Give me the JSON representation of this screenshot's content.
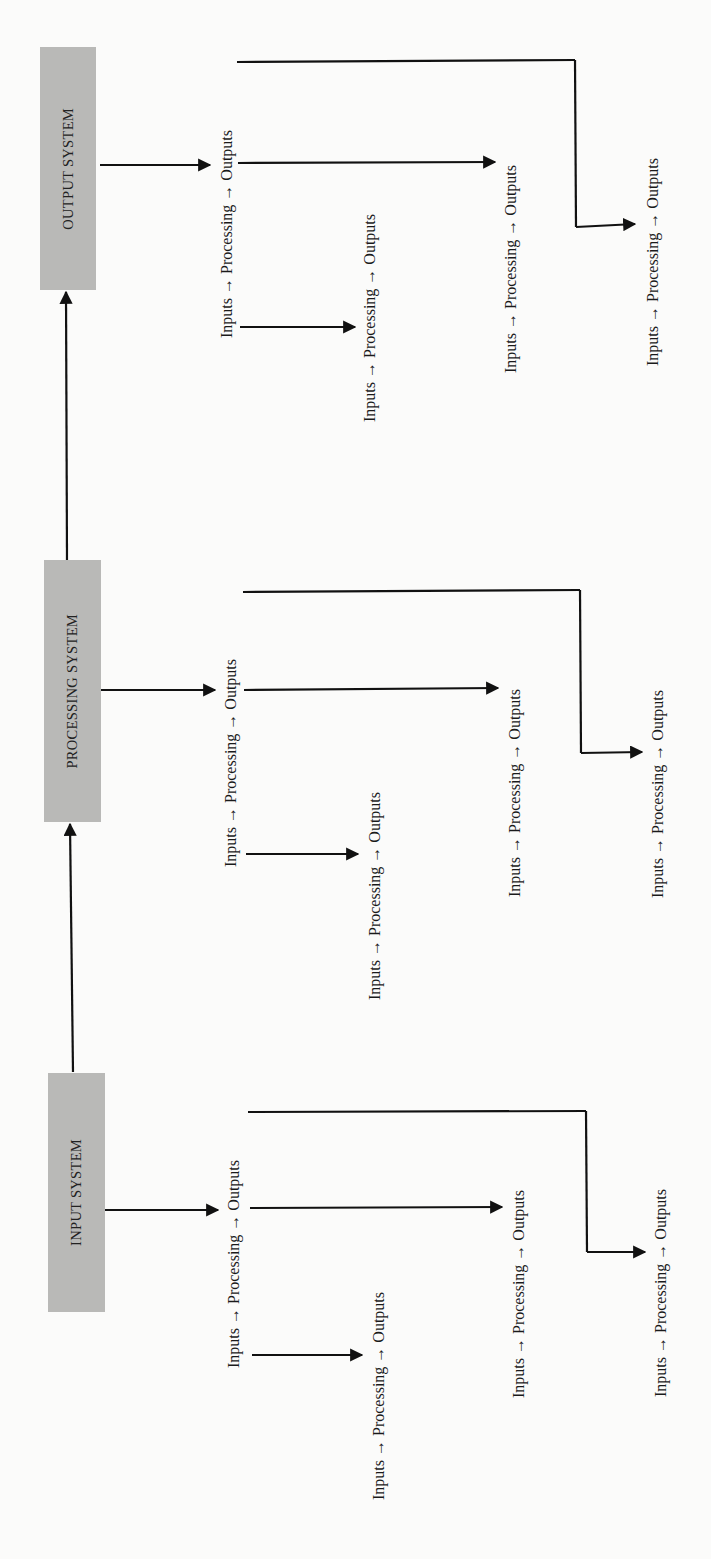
{
  "diagram": {
    "orientation": "rotated-90-ccw",
    "box_color": "#b9b9b7",
    "line_color": "#111111",
    "systems": [
      {
        "id": "output",
        "label": "OUTPUT SYSTEM",
        "flows": [
          {
            "text": "Inputs → Processing → Outputs",
            "role": "main"
          },
          {
            "text": "Inputs → Processing → Outputs",
            "role": "from-inputs"
          },
          {
            "text": "Inputs → Processing → Outputs",
            "role": "from-processing"
          },
          {
            "text": "Inputs → Processing → Outputs",
            "role": "from-outputs"
          }
        ]
      },
      {
        "id": "processing",
        "label": "PROCESSING SYSTEM",
        "flows": [
          {
            "text": "Inputs → Processing → Outputs",
            "role": "main"
          },
          {
            "text": "Inputs → Processing → Outputs",
            "role": "from-inputs"
          },
          {
            "text": "Inputs → Processing → Outputs",
            "role": "from-processing"
          },
          {
            "text": "Inputs → Processing → Outputs",
            "role": "from-outputs"
          }
        ]
      },
      {
        "id": "input",
        "label": "INPUT SYSTEM",
        "flows": [
          {
            "text": "Inputs → Processing → Outputs",
            "role": "main"
          },
          {
            "text": "Inputs → Processing → Outputs",
            "role": "from-inputs"
          },
          {
            "text": "Inputs → Processing → Outputs",
            "role": "from-processing"
          },
          {
            "text": "Inputs → Processing → Outputs",
            "role": "from-outputs"
          }
        ]
      }
    ],
    "connections": [
      {
        "from": "INPUT SYSTEM",
        "to": "PROCESSING SYSTEM"
      },
      {
        "from": "PROCESSING SYSTEM",
        "to": "OUTPUT SYSTEM"
      }
    ]
  }
}
